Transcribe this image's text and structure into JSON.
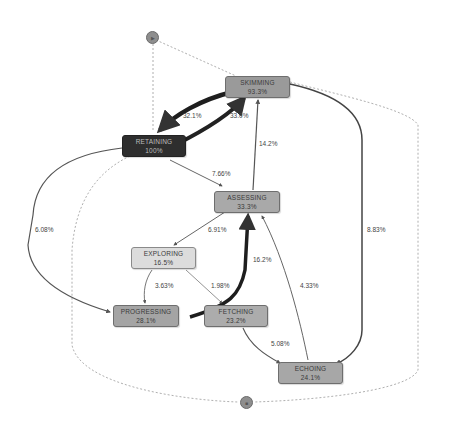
{
  "diagram": {
    "type": "process-map",
    "start_node": {
      "id": "start",
      "symbol": "▶"
    },
    "end_node": {
      "id": "end",
      "symbol": "■"
    },
    "nodes": [
      {
        "id": "skimming",
        "label": "SKIMMING",
        "value": "93.3%",
        "color": "#9a9a9a"
      },
      {
        "id": "retaining",
        "label": "RETAINING",
        "value": "100%",
        "color": "#2e2e2e"
      },
      {
        "id": "assessing",
        "label": "ASSESSING",
        "value": "33.3%",
        "color": "#a9a9a9"
      },
      {
        "id": "exploring",
        "label": "EXPLORING",
        "value": "16.5%",
        "color": "#dcdcdc"
      },
      {
        "id": "progressing",
        "label": "PROGRESSING",
        "value": "28.1%",
        "color": "#a4a4a4"
      },
      {
        "id": "fetching",
        "label": "FETCHING",
        "value": "23.2%",
        "color": "#acacac"
      },
      {
        "id": "echoing",
        "label": "ECHOING",
        "value": "24.1%",
        "color": "#a7a7a7"
      }
    ],
    "edges": [
      {
        "from": "skimming",
        "to": "retaining",
        "label": "32.1%"
      },
      {
        "from": "retaining",
        "to": "skimming",
        "label": "33.0%"
      },
      {
        "from": "assessing",
        "to": "skimming",
        "label": "14.2%"
      },
      {
        "from": "retaining",
        "to": "assessing",
        "label": "7.66%"
      },
      {
        "from": "retaining",
        "to": "progressing",
        "label": "6.08%"
      },
      {
        "from": "skimming",
        "to": "echoing",
        "label": "8.83%"
      },
      {
        "from": "assessing",
        "to": "exploring",
        "label": "6.91%"
      },
      {
        "from": "progressing",
        "to": "assessing",
        "label": "16.2%"
      },
      {
        "from": "exploring",
        "to": "progressing",
        "label": "3.63%"
      },
      {
        "from": "exploring",
        "to": "fetching",
        "label": "1.98%"
      },
      {
        "from": "echoing",
        "to": "assessing",
        "label": "4.33%"
      },
      {
        "from": "fetching",
        "to": "echoing",
        "label": "5.08%"
      },
      {
        "from": "start",
        "to": "skimming",
        "label": "",
        "style": "dashed"
      },
      {
        "from": "start",
        "to": "retaining",
        "label": "",
        "style": "dashed"
      },
      {
        "from": "retaining",
        "to": "end",
        "label": "",
        "style": "dashed"
      },
      {
        "from": "skimming",
        "to": "end",
        "label": "",
        "style": "dashed"
      }
    ]
  }
}
